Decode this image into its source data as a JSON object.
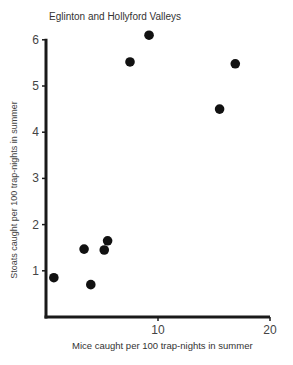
{
  "chart_data": {
    "type": "scatter",
    "title": "Eglinton and Hollyford Valleys",
    "xlabel": "Mice caught per 100 trap-nights in summer",
    "ylabel": "Stoats caught per 100 trap-nights in summer",
    "xlim": [
      0,
      20
    ],
    "ylim": [
      0,
      6
    ],
    "xticks": [
      10,
      20
    ],
    "yticks": [
      1,
      2,
      3,
      4,
      5,
      6
    ],
    "grid": false,
    "legend": null,
    "series": [
      {
        "name": "Eglinton and Hollyford Valleys",
        "color": "#111111",
        "points": [
          {
            "x": 0.7,
            "y": 0.85
          },
          {
            "x": 3.4,
            "y": 1.47
          },
          {
            "x": 4.0,
            "y": 0.7
          },
          {
            "x": 5.2,
            "y": 1.45
          },
          {
            "x": 5.5,
            "y": 1.65
          },
          {
            "x": 7.5,
            "y": 5.52
          },
          {
            "x": 9.2,
            "y": 6.1
          },
          {
            "x": 15.5,
            "y": 4.5
          },
          {
            "x": 16.9,
            "y": 5.48
          }
        ]
      }
    ]
  }
}
